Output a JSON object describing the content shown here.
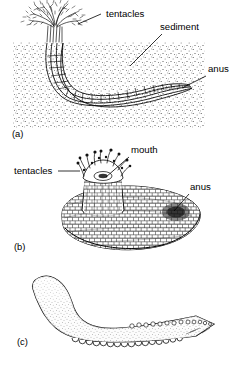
{
  "figure": {
    "background_color": "#ffffff",
    "ink_color": "#000000",
    "width": 243,
    "height": 372
  },
  "panels": [
    {
      "id": "a",
      "letter": "(a)",
      "caption_x": 12,
      "caption_y": 137,
      "description": "U-shaped animal burrowed in sediment with branched tentacle crown above the surface",
      "sediment_box": {
        "x": 13,
        "y": 42,
        "width": 192,
        "height": 86,
        "fill": "stipple"
      },
      "labels": [
        {
          "name": "tentacles",
          "text": "tentacles",
          "x": 106,
          "y": 17,
          "anchor": "start",
          "leader": {
            "x1": 101,
            "y1": 14,
            "x2": 78,
            "y2": 24
          }
        },
        {
          "name": "sediment",
          "text": "sediment",
          "x": 160,
          "y": 30,
          "anchor": "start",
          "leader": {
            "x1": 162,
            "y1": 34,
            "x2": 130,
            "y2": 66
          }
        },
        {
          "name": "anus",
          "text": "anus",
          "x": 208,
          "y": 72,
          "anchor": "start",
          "leader": {
            "x1": 206,
            "y1": 76,
            "x2": 182,
            "y2": 88
          }
        }
      ]
    },
    {
      "id": "b",
      "letter": "(b)",
      "caption_x": 14,
      "caption_y": 250,
      "description": "Loaf-shaped body with plated cobblestone surface, raised collar bearing a crown of tentacles around the mouth, anus at the right end",
      "labels": [
        {
          "name": "tentacles",
          "text": "tentacles",
          "x": 14,
          "y": 174,
          "anchor": "start",
          "leader": {
            "x1": 58,
            "y1": 171,
            "x2": 80,
            "y2": 171
          }
        },
        {
          "name": "mouth",
          "text": "mouth",
          "x": 131,
          "y": 153,
          "anchor": "start",
          "leader": {
            "x1": 129,
            "y1": 157,
            "x2": 106,
            "y2": 177
          }
        },
        {
          "name": "anus",
          "text": "anus",
          "x": 190,
          "y": 190,
          "anchor": "start",
          "leader": {
            "x1": 189,
            "y1": 194,
            "x2": 173,
            "y2": 212
          }
        }
      ]
    },
    {
      "id": "c",
      "letter": "(c)",
      "caption_x": 17,
      "caption_y": 345,
      "description": "S-curved elongate body, stippled shading, row of papillae along the dorsal posterior and scalloped tube feet along the ventral margin",
      "labels": [],
      "papillae_count": 13,
      "tube_feet_count": 16
    }
  ]
}
